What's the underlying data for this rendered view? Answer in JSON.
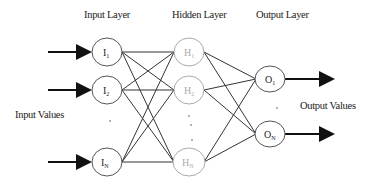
{
  "layers": {
    "input": {
      "title": "Input Layer",
      "nodes": [
        "I1",
        "I2",
        "IN"
      ]
    },
    "hidden": {
      "title": "Hidden Layer",
      "nodes": [
        "H1",
        "H2",
        "HN"
      ]
    },
    "output": {
      "title": "Output Layer",
      "nodes": [
        "O1",
        "ON"
      ]
    }
  },
  "side_labels": {
    "input_values": "Input Values",
    "output_values": "Output Values"
  },
  "node_labels": {
    "I1": {
      "main": "I",
      "sub": "1"
    },
    "I2": {
      "main": "I",
      "sub": "2"
    },
    "IN": {
      "main": "I",
      "sub": "N"
    },
    "H1": {
      "main": "H",
      "sub": "1"
    },
    "H2": {
      "main": "H",
      "sub": "2"
    },
    "HN": {
      "main": "H",
      "sub": "N"
    },
    "O1": {
      "main": "O",
      "sub": "1"
    },
    "ON": {
      "main": "O",
      "sub": "N"
    }
  },
  "ellipsis": "."
}
